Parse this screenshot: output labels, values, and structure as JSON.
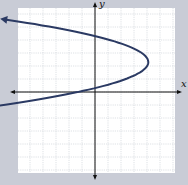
{
  "chart_data": {
    "type": "line",
    "title": "",
    "xlabel": "x",
    "ylabel": "y",
    "grid": true,
    "xlim": [
      -6,
      6
    ],
    "ylim": [
      -6.5,
      6.5
    ],
    "series": [
      {
        "name": "parabola",
        "x": [
          -5.8,
          -4,
          -2,
          0,
          2,
          3,
          4,
          3,
          2,
          0,
          -2,
          -4,
          -5.8
        ],
        "y": [
          5.4,
          5.1,
          4.8,
          4.3,
          3.5,
          3.1,
          2.3,
          1.3,
          0.8,
          -0.3,
          -1.0,
          -1.6,
          -2.0
        ]
      }
    ]
  },
  "colors": {
    "background": "#c9ccd6",
    "grid_bg": "#ffffff",
    "grid_line": "#c8ccd4",
    "axis": "#111111",
    "curve": "#2b3a63"
  }
}
